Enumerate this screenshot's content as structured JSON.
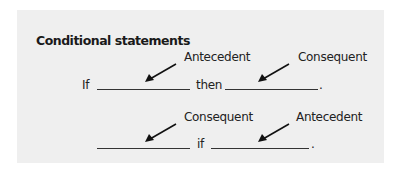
{
  "title": "Conditional statements",
  "colors": {
    "panel_background": "#efefef",
    "page_background": "#ffffff",
    "text": "#1a1a1a",
    "line": "#333333"
  },
  "rows": [
    {
      "form": "If ___ then ___.",
      "connective_start": "If",
      "connective_middle": "then",
      "end_punctuation": ".",
      "labels": [
        "Antecedent",
        "Consequent"
      ]
    },
    {
      "form": "___ if ___.",
      "connective_middle": "if",
      "end_punctuation": ".",
      "labels": [
        "Consequent",
        "Antecedent"
      ]
    }
  ],
  "icons": {
    "arrow": "arrow-down-left-icon"
  }
}
